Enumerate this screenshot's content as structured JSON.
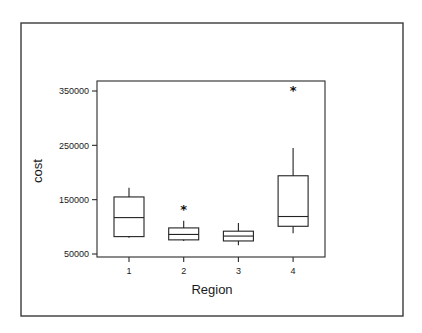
{
  "chart_data": {
    "type": "box",
    "title": "",
    "xlabel": "Region",
    "ylabel": "cost",
    "ylim": [
      45000,
      370000
    ],
    "yticks": [
      50000,
      150000,
      250000,
      350000
    ],
    "ytick_labels": [
      "50000",
      "150000",
      "250000",
      "350000"
    ],
    "categories": [
      "1",
      "2",
      "3",
      "4"
    ],
    "grid": false,
    "boxes": [
      {
        "category": "1",
        "whisker_low": 80000,
        "q1": 82000,
        "median": 117000,
        "q3": 155000,
        "whisker_high": 172000,
        "outliers": []
      },
      {
        "category": "2",
        "whisker_low": 74000,
        "q1": 76000,
        "median": 86000,
        "q3": 98000,
        "whisker_high": 111000,
        "outliers": [
          135000
        ]
      },
      {
        "category": "3",
        "whisker_low": 66000,
        "q1": 74000,
        "median": 83000,
        "q3": 92000,
        "whisker_high": 107000,
        "outliers": []
      },
      {
        "category": "4",
        "whisker_low": 88000,
        "q1": 101000,
        "median": 119000,
        "q3": 194000,
        "whisker_high": 245000,
        "outliers": [
          354000
        ]
      }
    ]
  }
}
